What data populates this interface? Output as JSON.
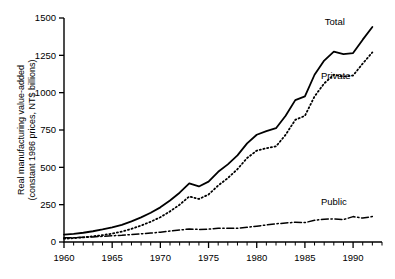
{
  "chart_data": {
    "type": "line",
    "title": "",
    "xlabel": "",
    "ylabel": "Real manufacturing value-added (constant 1986 prices, NT$ billions)",
    "ylabel_line1": "Real manufacturing value-added",
    "ylabel_line2": "(constant 1986 prices, NT$ billions)",
    "xlim": [
      1960,
      1993
    ],
    "ylim": [
      0,
      1500
    ],
    "ytick_labels": [
      "0",
      "250",
      "500",
      "750",
      "1000",
      "1250",
      "1500"
    ],
    "yticks": [
      0,
      250,
      500,
      750,
      1000,
      1250,
      1500
    ],
    "xtick_labels": [
      "1960",
      "1965",
      "1970",
      "1975",
      "1980",
      "1985",
      "1990"
    ],
    "xticks": [
      1960,
      1965,
      1970,
      1975,
      1980,
      1985,
      1990
    ],
    "xminor_step": 1,
    "grid": false,
    "legend_position": "inline-annotations",
    "x": [
      1960,
      1961,
      1962,
      1963,
      1964,
      1965,
      1966,
      1967,
      1968,
      1969,
      1970,
      1971,
      1972,
      1973,
      1974,
      1975,
      1976,
      1977,
      1978,
      1979,
      1980,
      1981,
      1982,
      1983,
      1984,
      1985,
      1986,
      1987,
      1988,
      1989,
      1990,
      1991,
      1992
    ],
    "series": [
      {
        "name": "Total",
        "style": "solid",
        "label": "Total",
        "label_x": 1988.1,
        "label_y": 1455,
        "values": [
          50,
          55,
          62,
          72,
          84,
          98,
          115,
          138,
          165,
          196,
          232,
          278,
          330,
          392,
          372,
          404,
          470,
          520,
          580,
          660,
          718,
          742,
          762,
          845,
          950,
          975,
          1120,
          1215,
          1275,
          1258,
          1265,
          1355,
          1440
        ]
      },
      {
        "name": "Private",
        "style": "dotted",
        "label": "Private",
        "label_x": 1988.2,
        "label_y": 1090,
        "values": [
          22,
          26,
          31,
          38,
          46,
          56,
          70,
          88,
          110,
          136,
          166,
          205,
          250,
          305,
          288,
          318,
          378,
          428,
          488,
          562,
          612,
          628,
          640,
          718,
          818,
          845,
          975,
          1062,
          1120,
          1108,
          1115,
          1195,
          1270
        ]
      },
      {
        "name": "Public",
        "style": "dash-dot",
        "label": "Public",
        "label_x": 1988.0,
        "label_y": 245,
        "values": [
          28,
          29,
          31,
          34,
          38,
          42,
          45,
          50,
          55,
          60,
          66,
          73,
          80,
          87,
          84,
          86,
          92,
          92,
          92,
          98,
          106,
          114,
          122,
          127,
          132,
          130,
          145,
          153,
          155,
          150,
          170,
          160,
          170
        ]
      }
    ]
  }
}
